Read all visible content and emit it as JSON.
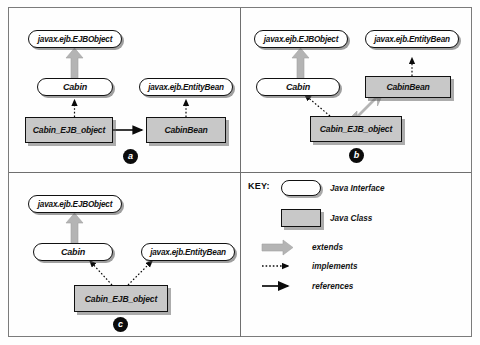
{
  "figure": {
    "panels": [
      {
        "id": "a",
        "marker": "a",
        "nodes": {
          "ejbobject": "javax.ejb.EJBObject",
          "cabin": "Cabin",
          "entitybean": "javax.ejb.EntityBean",
          "ejbobj_impl": "Cabin_EJB_object",
          "cabinbean": "CabinBean"
        }
      },
      {
        "id": "b",
        "marker": "b",
        "nodes": {
          "ejbobject": "javax.ejb.EJBObject",
          "cabin": "Cabin",
          "entitybean": "javax.ejb.EntityBean",
          "cabinbean": "CabinBean",
          "ejbobj_impl": "Cabin_EJB_object"
        }
      },
      {
        "id": "c",
        "marker": "c",
        "nodes": {
          "ejbobject": "javax.ejb.EJBObject",
          "cabin": "Cabin",
          "entitybean": "javax.ejb.EntityBean",
          "ejbobj_impl": "Cabin_EJB_object"
        }
      }
    ],
    "key": {
      "title": "KEY:",
      "entries": [
        {
          "symbol": "rounded-rect",
          "label": "Java Interface"
        },
        {
          "symbol": "gray-rect",
          "label": "Java Class"
        },
        {
          "symbol": "thick-gray-arrow",
          "label": "extends"
        },
        {
          "symbol": "dotted-arrow",
          "label": "implements"
        },
        {
          "symbol": "solid-arrow",
          "label": "references"
        }
      ]
    },
    "colors": {
      "class_fill": "#c8c8c8",
      "interface_fill": "#ffffff",
      "stroke": "#111111",
      "extends_arrow": "#b4b4b4",
      "marker_fill": "#0b0b0b",
      "frame": "#7b7b7b"
    }
  }
}
